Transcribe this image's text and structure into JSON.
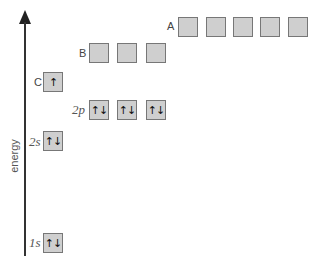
{
  "axis": {
    "label": "energy"
  },
  "levels": [
    {
      "id": "A",
      "label": "A",
      "italic": false,
      "lx": 167,
      "ly": 20,
      "y": 17,
      "boxes": [
        {
          "x": 178,
          "e": ""
        },
        {
          "x": 206,
          "e": ""
        },
        {
          "x": 233,
          "e": ""
        },
        {
          "x": 260,
          "e": ""
        },
        {
          "x": 288,
          "e": ""
        }
      ]
    },
    {
      "id": "B",
      "label": "B",
      "italic": false,
      "lx": 79,
      "ly": 47,
      "y": 43,
      "boxes": [
        {
          "x": 89,
          "e": ""
        },
        {
          "x": 117,
          "e": ""
        },
        {
          "x": 146,
          "e": ""
        }
      ]
    },
    {
      "id": "C",
      "label": "C",
      "italic": false,
      "lx": 34,
      "ly": 76,
      "y": 72,
      "boxes": [
        {
          "x": 43,
          "e": "↑"
        }
      ]
    },
    {
      "id": "2p",
      "label": "2p",
      "italic": true,
      "lx": 72,
      "ly": 102,
      "y": 100,
      "boxes": [
        {
          "x": 89,
          "e": "↑↓"
        },
        {
          "x": 117,
          "e": "↑↓"
        },
        {
          "x": 146,
          "e": "↑↓"
        }
      ]
    },
    {
      "id": "2s",
      "label": "2s",
      "italic": true,
      "lx": 29,
      "ly": 134,
      "y": 131,
      "boxes": [
        {
          "x": 43,
          "e": "↑↓"
        }
      ]
    },
    {
      "id": "1s",
      "label": "1s",
      "italic": true,
      "lx": 29,
      "ly": 235,
      "y": 233,
      "boxes": [
        {
          "x": 43,
          "e": "↑↓"
        }
      ]
    }
  ]
}
